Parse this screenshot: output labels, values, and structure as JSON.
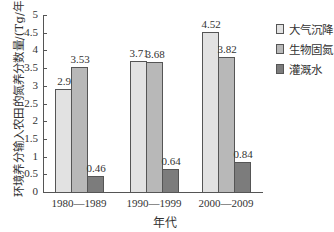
{
  "chart_data": {
    "type": "bar",
    "title": "",
    "xlabel": "年代",
    "ylabel": "环境养分输入农田的氮养分数量/(Tg/年)",
    "ylim": [
      0,
      5
    ],
    "yticks": [
      "0",
      "0.5",
      "1",
      "1.5",
      "2",
      "2.5",
      "3",
      "3.5",
      "4",
      "4.5",
      "5"
    ],
    "categories": [
      "1980—1989",
      "1990—1999",
      "2000—2009"
    ],
    "series": [
      {
        "name": "大气沉降",
        "values": [
          2.9,
          3.71,
          4.52
        ],
        "color": "#e2e2e2"
      },
      {
        "name": "生物固氮",
        "values": [
          3.53,
          3.68,
          3.82
        ],
        "color": "#b8b8b8"
      },
      {
        "name": "灌溉水",
        "values": [
          0.46,
          0.64,
          0.84
        ],
        "color": "#7c7c7c"
      }
    ],
    "value_labels": [
      [
        "2.9",
        "3.53",
        "0.46"
      ],
      [
        "3.71",
        "3.68",
        "0.64"
      ],
      [
        "4.52",
        "3.82",
        "0.84"
      ]
    ],
    "grid": false,
    "legend_position": "right"
  }
}
